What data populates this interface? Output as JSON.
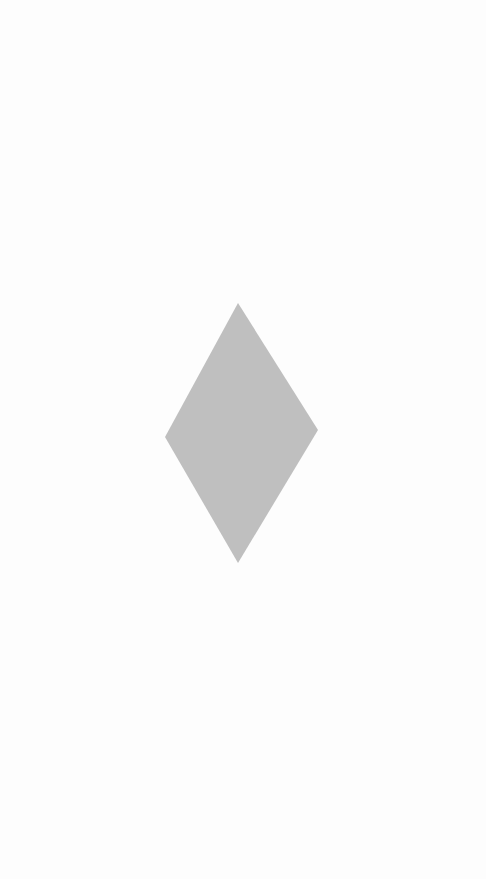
{
  "screen": {
    "background_color": "#fdfdfd"
  },
  "shape": {
    "type": "diamond",
    "fill_color": "#bfbfbf",
    "points": "238,303 318,430 238,563 165,437"
  }
}
